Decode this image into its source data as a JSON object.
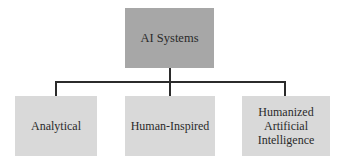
{
  "diagram": {
    "type": "hierarchy",
    "root": {
      "label": "AI Systems",
      "color": "#a7a7a7"
    },
    "children": [
      {
        "label": "Analytical",
        "color": "#d9d9d9"
      },
      {
        "label": "Human-Inspired",
        "color": "#d9d9d9"
      },
      {
        "label": "Humanized Artificial Intelligence",
        "color": "#d9d9d9"
      }
    ],
    "connector_color": "#2b2b2b"
  }
}
